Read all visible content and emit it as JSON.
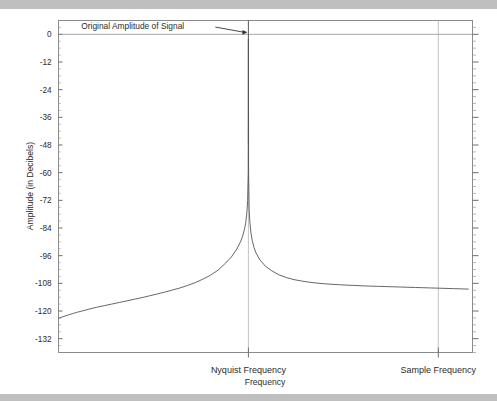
{
  "figure": {
    "background_color": "#ffffff",
    "band_color": "#bfbfbf"
  },
  "chart_data": {
    "type": "line",
    "title": "",
    "subtitle": "",
    "xlabel": "Frequency",
    "ylabel": "Amplitude (in Decibels)",
    "grid": false,
    "legend_position": "none",
    "xlim": [
      0,
      1.09
    ],
    "ylim": [
      -138,
      6
    ],
    "ytick_labels": [
      "0",
      "-12",
      "-24",
      "-36",
      "-48",
      "-60",
      "-72",
      "-84",
      "-96",
      "-108",
      "-120",
      "-132"
    ],
    "ytick_values": [
      0,
      -12,
      -24,
      -36,
      -48,
      -60,
      -72,
      -84,
      -96,
      -108,
      -120,
      -132
    ],
    "yminor_interval": 3,
    "xtick_labels": [
      "Nyquist Frequency",
      "Sample Frequency"
    ],
    "xtick_values": [
      0.5,
      1.0
    ],
    "annotations": [
      {
        "text": "Original Amplitude of Signal",
        "x": 0.06,
        "y": 2.5,
        "arrow_to_x": 0.5,
        "arrow_to_y": 0.0
      }
    ],
    "series": [
      {
        "name": "Aliased amplitude spectrum",
        "x": [
          0.0,
          0.01,
          0.02,
          0.03,
          0.04,
          0.05,
          0.06,
          0.08,
          0.1,
          0.12,
          0.14,
          0.16,
          0.18,
          0.2,
          0.22,
          0.24,
          0.26,
          0.28,
          0.3,
          0.32,
          0.34,
          0.36,
          0.38,
          0.4,
          0.42,
          0.44,
          0.455,
          0.47,
          0.48,
          0.485,
          0.49,
          0.493,
          0.496,
          0.498,
          0.4995,
          0.5,
          0.5005,
          0.502,
          0.504,
          0.507,
          0.51,
          0.515,
          0.52,
          0.53,
          0.545,
          0.56,
          0.58,
          0.6,
          0.62,
          0.64,
          0.66,
          0.68,
          0.7,
          0.72,
          0.74,
          0.76,
          0.78,
          0.8,
          0.82,
          0.84,
          0.86,
          0.88,
          0.9,
          0.92,
          0.94,
          0.96,
          0.98,
          1.0,
          1.02,
          1.04,
          1.06,
          1.08
        ],
        "y": [
          -123.2,
          -122.6,
          -122.0,
          -121.5,
          -121.0,
          -120.5,
          -120.1,
          -119.2,
          -118.4,
          -117.7,
          -117.0,
          -116.3,
          -115.6,
          -114.9,
          -114.2,
          -113.4,
          -112.6,
          -111.8,
          -110.9,
          -110.0,
          -108.9,
          -107.7,
          -106.2,
          -104.5,
          -102.3,
          -99.2,
          -96.6,
          -93.0,
          -89.7,
          -87.4,
          -84.3,
          -81.6,
          -77.2,
          -72.0,
          -60.0,
          -2.0,
          -60.0,
          -76.0,
          -82.0,
          -86.5,
          -89.4,
          -92.6,
          -94.8,
          -97.8,
          -100.6,
          -102.4,
          -104.3,
          -105.5,
          -106.4,
          -107.0,
          -107.5,
          -107.9,
          -108.2,
          -108.4,
          -108.6,
          -108.8,
          -108.9,
          -109.1,
          -109.2,
          -109.3,
          -109.4,
          -109.5,
          -109.6,
          -109.7,
          -109.8,
          -109.9,
          -110.0,
          -110.1,
          -110.2,
          -110.3,
          -110.4,
          -110.5
        ]
      }
    ]
  }
}
